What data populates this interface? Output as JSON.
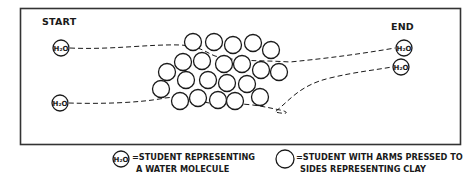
{
  "diagram": {
    "title_start": "START",
    "title_end": "END",
    "molecule_label": "H₂O",
    "colors": {
      "ink": "#1a1a1a",
      "frame": "#333333",
      "background": "#ffffff"
    },
    "start_molecules": [
      {
        "id": "start-top",
        "x": 61,
        "y": 48
      },
      {
        "id": "start-bottom",
        "x": 60,
        "y": 103
      }
    ],
    "end_molecules": [
      {
        "id": "end-top",
        "x": 404,
        "y": 48
      },
      {
        "id": "end-bottom",
        "x": 401,
        "y": 67
      }
    ],
    "clay_particle_count": 23
  },
  "legend": {
    "water": {
      "symbol": "H₂O",
      "line1": "=STUDENT REPRESENTING",
      "line2": "A WATER MOLECULE"
    },
    "clay": {
      "line1": "=STUDENT WITH ARMS PRESSED TO",
      "line2": "SIDES REPRESENTING CLAY"
    }
  }
}
